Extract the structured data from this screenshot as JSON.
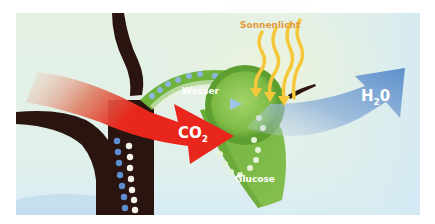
{
  "diagram": {
    "topic": "Photosynthese",
    "labels": {
      "sunlight": "Sonnenlicht",
      "water": "Wasser",
      "co2_main": "CO",
      "co2_sub": "2",
      "h2o_h": "H",
      "h2o_sub": "2",
      "h2o_o": "0",
      "glucose": "Glucose"
    },
    "colors": {
      "background_top": "#e4f1e3",
      "background_bottom": "#dcefF6",
      "trunk": "#2a1410",
      "co2_arrow": "#e8261b",
      "co2_arrow_fade": "#e9b39a",
      "h2o_arrow": "#5a8fcc",
      "h2o_arrow_fade": "#b8cfe6",
      "leaf": "#7ab743",
      "leaf_dark": "#4f9a2e",
      "chloroplast": "#8cc554",
      "sunlight": "#f5c83a",
      "sunlight_label": "#e39a3b",
      "water_dot": "#8fb4e0",
      "glucose_dot": "#e6f2d6",
      "trunk_dot_blue": "#5d8fcf",
      "trunk_dot_white": "#f4f1ea"
    }
  }
}
